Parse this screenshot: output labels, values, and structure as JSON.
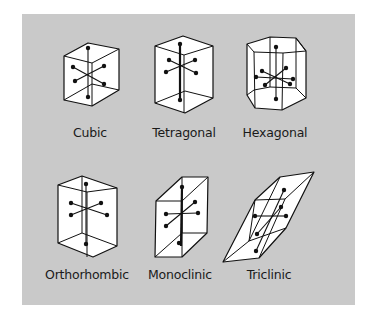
{
  "figure": {
    "crystals": [
      {
        "name": "cubic",
        "label": "Cubic"
      },
      {
        "name": "tetragonal",
        "label": "Tetragonal"
      },
      {
        "name": "hexagonal",
        "label": "Hexagonal"
      },
      {
        "name": "orthorhombic",
        "label": "Orthorhombic"
      },
      {
        "name": "monoclinic",
        "label": "Monoclinic"
      },
      {
        "name": "triclinic",
        "label": "Triclinic"
      }
    ]
  },
  "colors": {
    "panel_background": "#c9c9c9",
    "crystal_face": "#ffffff",
    "line": "#111111"
  }
}
